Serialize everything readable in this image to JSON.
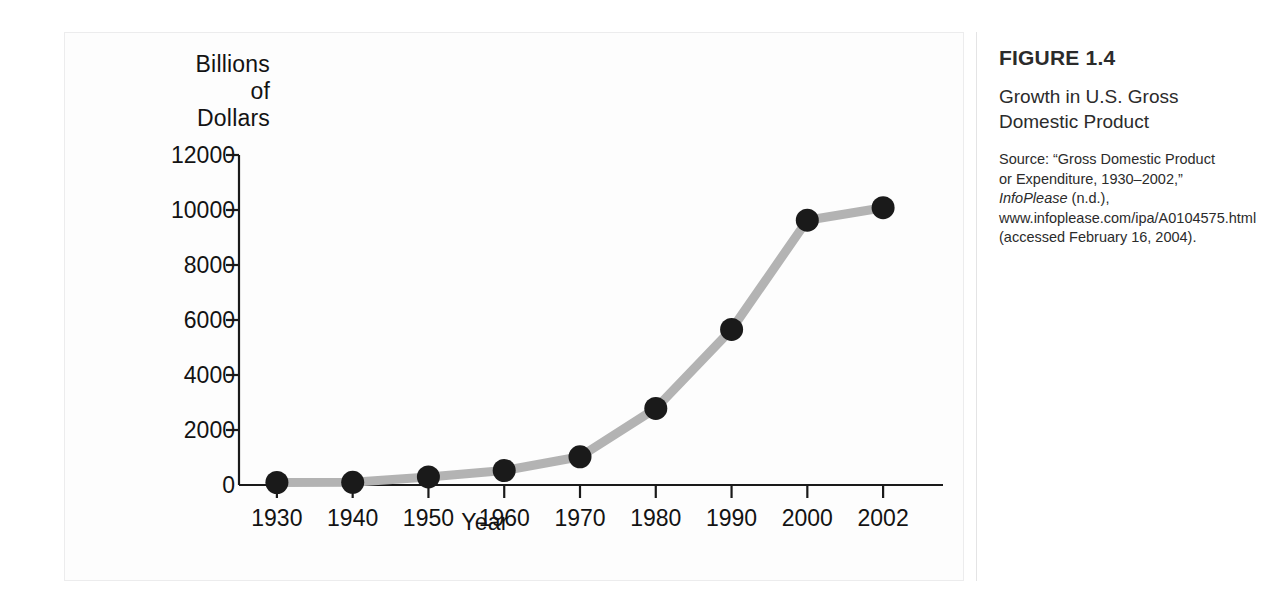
{
  "figure": {
    "number": "FIGURE 1.4",
    "title": "Growth in U.S. Gross Domestic Product",
    "source_prefix": "Source: “Gross Domestic Product or Expenditure, 1930–2002,” ",
    "source_italic": "InfoPlease",
    "source_suffix": " (n.d.), www.infoplease.com/ipa/A0104575.html (accessed February 16, 2004)."
  },
  "colors": {
    "line": "#b3b3b3",
    "marker": "#1a1a1a",
    "axis": "#1a1a1a",
    "panel_border": "#ececed",
    "divider": "#e4e4e5",
    "text": "#131313"
  },
  "chart_data": {
    "type": "line",
    "title": "Growth in U.S. Gross Domestic Product",
    "xlabel": "Year",
    "ylabel": "Billions\nof\nDollars",
    "categories": [
      "1930",
      "1940",
      "1950",
      "1960",
      "1970",
      "1980",
      "1990",
      "2000",
      "2002"
    ],
    "x": [
      1930,
      1940,
      1950,
      1960,
      1970,
      1980,
      1990,
      2000,
      2002
    ],
    "values": [
      91,
      100,
      294,
      527,
      1026,
      2784,
      5659,
      9629,
      10083
    ],
    "series": [
      {
        "name": "U.S. Gross Domestic Product",
        "values": [
          91,
          100,
          294,
          527,
          1026,
          2784,
          5659,
          9629,
          10083
        ]
      }
    ],
    "xtick_labels": [
      "1930",
      "1940",
      "1950",
      "1960",
      "1970",
      "1980",
      "1990",
      "2000",
      "2002"
    ],
    "ytick_labels": [
      "0",
      "2000",
      "4000",
      "6000",
      "8000",
      "10000",
      "12000"
    ],
    "yticks": [
      0,
      2000,
      4000,
      6000,
      8000,
      10000,
      12000
    ],
    "ylim": [
      0,
      12000
    ],
    "grid": false,
    "legend": false,
    "marker": "circle",
    "line_color": "#b3b3b3",
    "marker_color": "#1a1a1a"
  }
}
